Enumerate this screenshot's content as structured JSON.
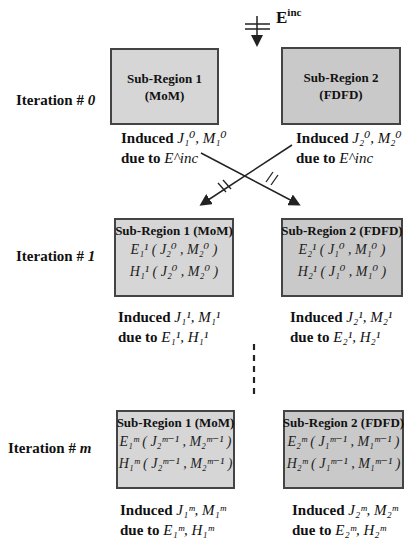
{
  "diagram": {
    "incident_field": {
      "label": "E",
      "superscript": "inc"
    },
    "iterations": [
      {
        "label_prefix": "Iteration # ",
        "index": "0",
        "region1": {
          "title_line1": "Sub-Region 1",
          "title_line2": "(MoM)"
        },
        "region2": {
          "title_line1": "Sub-Region 2",
          "title_line2": "(FDFD)"
        },
        "induced1": {
          "word": "Induced",
          "currents": "J₁⁰, M₁⁰",
          "due_to": "due to",
          "source": "E^inc"
        },
        "induced2": {
          "word": "Induced",
          "currents": "J₂⁰, M₂⁰",
          "due_to": "due to",
          "source": "E^inc"
        }
      },
      {
        "label_prefix": "Iteration # ",
        "index": "1",
        "region1": {
          "title": "Sub-Region 1 (MoM)",
          "eq_e": "E₁¹ ( J₂⁰ , M₂⁰ )",
          "eq_h": "H₁¹ ( J₂⁰ , M₂⁰ )"
        },
        "region2": {
          "title": "Sub-Region 2 (FDFD)",
          "eq_e": "E₂¹ ( J₁⁰ , M₁⁰ )",
          "eq_h": "H₂¹ ( J₁⁰ , M₁⁰ )"
        },
        "induced1": {
          "word": "Induced",
          "currents": "J₁¹, M₁¹",
          "due_to": "due to",
          "source": "E₁¹, H₁¹"
        },
        "induced2": {
          "word": "Induced",
          "currents": "J₂¹, M₂¹",
          "due_to": "due to",
          "source": "E₂¹, H₂¹"
        }
      },
      {
        "label_prefix": "Iteration # ",
        "index": "m",
        "region1": {
          "title": "Sub-Region 1 (MoM)",
          "eq_e": "E₁ᵐ ( J₂ᵐ⁻¹ , M₂ᵐ⁻¹ )",
          "eq_h": "H₁ᵐ ( J₂ᵐ⁻¹ , M₂ᵐ⁻¹ )"
        },
        "region2": {
          "title": "Sub-Region 2 (FDFD)",
          "eq_e": "E₂ᵐ ( J₁ᵐ⁻¹ , M₁ᵐ⁻¹ )",
          "eq_h": "H₂ᵐ ( J₁ᵐ⁻¹ , M₁ᵐ⁻¹ )"
        },
        "induced1": {
          "word": "Induced",
          "currents": "J₁ᵐ, M₁ᵐ",
          "due_to": "due to",
          "source": "E₁ᵐ, H₁ᵐ"
        },
        "induced2": {
          "word": "Induced",
          "currents": "J₂ᵐ, M₂ᵐ",
          "due_to": "due to",
          "source": "E₂ᵐ, H₂ᵐ"
        }
      }
    ],
    "colors": {
      "region1_fill": "#d6d6d6",
      "region2_fill": "#c9c9c9",
      "border": "#444444",
      "line": "#222222"
    }
  }
}
